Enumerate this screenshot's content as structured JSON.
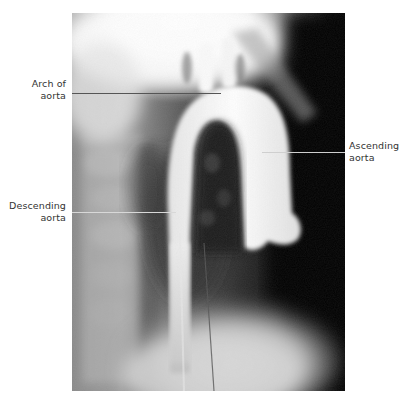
{
  "figure": {
    "labels": [
      {
        "id": "arch",
        "line1": "Arch of",
        "line2": "aorta"
      },
      {
        "id": "ascending",
        "line1": "Ascending",
        "line2": "aorta"
      },
      {
        "id": "descending",
        "line1": "Descending",
        "line2": "aorta"
      }
    ],
    "colors": {
      "background": "#ffffff",
      "label_text": "#333333",
      "leader_on_light": "#555555",
      "leader_on_dark": "#cfcfcf"
    }
  }
}
